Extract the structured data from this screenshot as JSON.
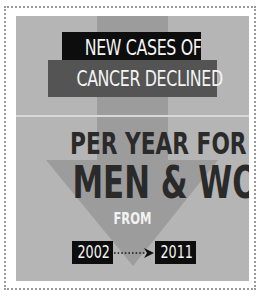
{
  "infographic": {
    "headline": {
      "line1": "NEW CASES OF",
      "line2": "CANCER DECLINED",
      "line3": "PER YEAR FOR BOTH",
      "line4": "MEN & WOMEN"
    },
    "from_label": "FROM",
    "period": {
      "start_year": "2002",
      "end_year": "2011"
    },
    "icons": {
      "main_arrow": "down-arrow-icon",
      "timeline_arrow": "dotted-right-arrow-icon"
    },
    "colors": {
      "panel_background": "#b5b5b5",
      "arrow_fill": "#9c9c9c",
      "title_box_dark": "#0d0d0d",
      "title_box_gray": "#545454",
      "headline_text": "#2a2a2a",
      "light_text": "#f4f4f4",
      "border_dots": "#9a9a9a"
    }
  }
}
